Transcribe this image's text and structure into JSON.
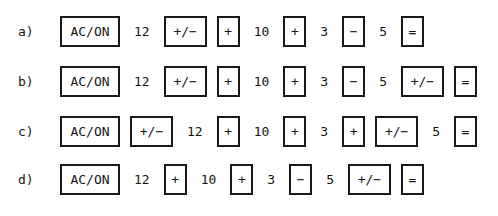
{
  "figure": {
    "kind": "calculator-keystroke-sequences",
    "background_color": "#ffffff",
    "ink_color": "#141414",
    "key_border_color": "#1a1a1a"
  },
  "rows": [
    {
      "label": "a)",
      "tokens": [
        {
          "text": "AC/ON",
          "kind": "key",
          "size": "wide"
        },
        {
          "text": "12",
          "kind": "number"
        },
        {
          "text": "+/−",
          "kind": "key",
          "size": "signchange"
        },
        {
          "text": "+",
          "kind": "key",
          "size": "narrow"
        },
        {
          "text": "10",
          "kind": "number"
        },
        {
          "text": "+",
          "kind": "key",
          "size": "narrow"
        },
        {
          "text": "3",
          "kind": "number"
        },
        {
          "text": "−",
          "kind": "key",
          "size": "narrow"
        },
        {
          "text": "5",
          "kind": "number"
        },
        {
          "text": "=",
          "kind": "key",
          "size": "narrow"
        }
      ]
    },
    {
      "label": "b)",
      "tokens": [
        {
          "text": "AC/ON",
          "kind": "key",
          "size": "wide"
        },
        {
          "text": "12",
          "kind": "number"
        },
        {
          "text": "+/−",
          "kind": "key",
          "size": "signchange"
        },
        {
          "text": "+",
          "kind": "key",
          "size": "narrow"
        },
        {
          "text": "10",
          "kind": "number"
        },
        {
          "text": "+",
          "kind": "key",
          "size": "narrow"
        },
        {
          "text": "3",
          "kind": "number"
        },
        {
          "text": "−",
          "kind": "key",
          "size": "narrow"
        },
        {
          "text": "5",
          "kind": "number"
        },
        {
          "text": "+/−",
          "kind": "key",
          "size": "signchange"
        },
        {
          "text": "=",
          "kind": "key",
          "size": "narrow"
        }
      ]
    },
    {
      "label": "c)",
      "tokens": [
        {
          "text": "AC/ON",
          "kind": "key",
          "size": "wide"
        },
        {
          "text": "+/−",
          "kind": "key",
          "size": "signchange"
        },
        {
          "text": "12",
          "kind": "number"
        },
        {
          "text": "+",
          "kind": "key",
          "size": "narrow"
        },
        {
          "text": "10",
          "kind": "number"
        },
        {
          "text": "+",
          "kind": "key",
          "size": "narrow"
        },
        {
          "text": "3",
          "kind": "number"
        },
        {
          "text": "+",
          "kind": "key",
          "size": "narrow"
        },
        {
          "text": "+/−",
          "kind": "key",
          "size": "signchange"
        },
        {
          "text": "5",
          "kind": "number"
        },
        {
          "text": "=",
          "kind": "key",
          "size": "narrow"
        }
      ]
    },
    {
      "label": "d)",
      "tokens": [
        {
          "text": "AC/ON",
          "kind": "key",
          "size": "wide"
        },
        {
          "text": "12",
          "kind": "number"
        },
        {
          "text": "+",
          "kind": "key",
          "size": "narrow"
        },
        {
          "text": "10",
          "kind": "number"
        },
        {
          "text": "+",
          "kind": "key",
          "size": "narrow"
        },
        {
          "text": "3",
          "kind": "number"
        },
        {
          "text": "−",
          "kind": "key",
          "size": "narrow"
        },
        {
          "text": "5",
          "kind": "number"
        },
        {
          "text": "+/−",
          "kind": "key",
          "size": "signchange"
        },
        {
          "text": "=",
          "kind": "key",
          "size": "narrow"
        }
      ]
    }
  ],
  "layout": {
    "row_tops": [
      6,
      56,
      106,
      154
    ],
    "label_left": 18,
    "strip_left": 55
  }
}
